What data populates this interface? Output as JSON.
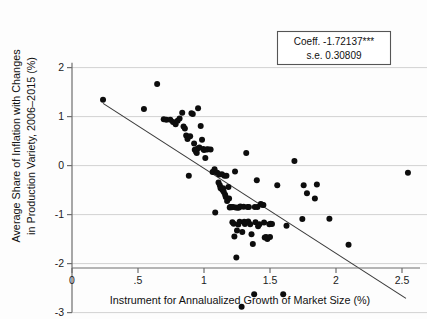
{
  "chart_data": {
    "type": "scatter",
    "title": "",
    "xlabel": "Instrument for Annalualized Growth of Market Size (%)",
    "ylabel_line1": "Average Share of Inflation with Changes",
    "ylabel_line2": "in Production Variety, 2006–2015 (%)",
    "xlim": [
      0,
      2.6
    ],
    "ylim": [
      -3.1,
      2.1
    ],
    "grid": "horizontal",
    "legend_position": "top-right",
    "xticks": [
      0,
      0.5,
      1,
      1.5,
      2,
      2.5
    ],
    "xticklabels": [
      "0",
      ".5",
      "1",
      "1.5",
      "2",
      "2.5"
    ],
    "yticks": [
      2,
      1,
      0,
      -1,
      -2,
      -3
    ],
    "yticklabels": [
      "2",
      "1",
      "0",
      "-1",
      "-2",
      "-3"
    ],
    "annotations": {
      "coefficient_label": "Coeff. -1.72137***",
      "std_error_label": "s.e. 0.30809",
      "coefficient_value": -1.72137,
      "std_error_value": 0.30809,
      "significance": "***"
    },
    "fit_line": {
      "type": "linear",
      "x_start": 0.235,
      "y_start": 1.27,
      "x_end": 2.53,
      "y_end": -2.71
    },
    "points": [
      [
        0.235,
        1.345
      ],
      [
        0.545,
        1.155
      ],
      [
        0.645,
        1.665
      ],
      [
        0.695,
        0.945
      ],
      [
        0.715,
        0.935
      ],
      [
        0.745,
        0.935
      ],
      [
        0.765,
        0.89
      ],
      [
        0.785,
        0.845
      ],
      [
        0.8,
        0.915
      ],
      [
        0.815,
        0.96
      ],
      [
        0.835,
        1.08
      ],
      [
        0.845,
        0.8
      ],
      [
        0.855,
        0.755
      ],
      [
        0.865,
        0.615
      ],
      [
        0.875,
        0.545
      ],
      [
        0.885,
        -0.205
      ],
      [
        0.895,
        0.6
      ],
      [
        0.905,
        1.07
      ],
      [
        0.915,
        1.055
      ],
      [
        0.925,
        0.45
      ],
      [
        0.93,
        0.325
      ],
      [
        0.94,
        0.285
      ],
      [
        0.945,
        0.255
      ],
      [
        0.95,
        0.345
      ],
      [
        0.955,
        1.17
      ],
      [
        0.965,
        0.37
      ],
      [
        0.975,
        0.81
      ],
      [
        0.985,
        0.53
      ],
      [
        0.995,
        0.34
      ],
      [
        1.0,
        0.32
      ],
      [
        1.01,
        0.155
      ],
      [
        1.02,
        0.33
      ],
      [
        1.03,
        0.335
      ],
      [
        1.05,
        0.33
      ],
      [
        1.065,
        -0.13
      ],
      [
        1.075,
        -0.125
      ],
      [
        1.08,
        -0.075
      ],
      [
        1.085,
        -0.955
      ],
      [
        1.1,
        -0.145
      ],
      [
        1.11,
        -0.345
      ],
      [
        1.115,
        -0.18
      ],
      [
        1.12,
        -0.4
      ],
      [
        1.125,
        -0.455
      ],
      [
        1.13,
        -0.465
      ],
      [
        1.135,
        -0.175
      ],
      [
        1.14,
        -0.5
      ],
      [
        1.145,
        -0.46
      ],
      [
        1.15,
        -0.54
      ],
      [
        1.155,
        -0.205
      ],
      [
        1.16,
        -0.595
      ],
      [
        1.165,
        -0.64
      ],
      [
        1.17,
        -0.205
      ],
      [
        1.175,
        -0.72
      ],
      [
        1.185,
        -0.435
      ],
      [
        1.19,
        -0.67
      ],
      [
        1.195,
        -0.855
      ],
      [
        1.2,
        -0.845
      ],
      [
        1.21,
        -0.85
      ],
      [
        1.215,
        -1.155
      ],
      [
        1.22,
        -0.845
      ],
      [
        1.225,
        -1.185
      ],
      [
        1.23,
        -1.445
      ],
      [
        1.235,
        -0.12
      ],
      [
        1.24,
        -0.855
      ],
      [
        1.245,
        -1.875
      ],
      [
        1.25,
        -1.325
      ],
      [
        1.255,
        -0.86
      ],
      [
        1.26,
        -1.2
      ],
      [
        1.265,
        -0.855
      ],
      [
        1.27,
        -1.145
      ],
      [
        1.275,
        -0.835
      ],
      [
        1.285,
        -2.88
      ],
      [
        1.29,
        -1.355
      ],
      [
        1.3,
        -0.84
      ],
      [
        1.305,
        -1.145
      ],
      [
        1.31,
        -1.19
      ],
      [
        1.32,
        0.255
      ],
      [
        1.33,
        -0.845
      ],
      [
        1.335,
        -1.14
      ],
      [
        1.34,
        -0.845
      ],
      [
        1.35,
        -1.195
      ],
      [
        1.36,
        -1.4
      ],
      [
        1.37,
        -1.6
      ],
      [
        1.38,
        -2.625
      ],
      [
        1.385,
        -0.845
      ],
      [
        1.39,
        -1.155
      ],
      [
        1.4,
        -0.3
      ],
      [
        1.405,
        -0.845
      ],
      [
        1.41,
        -1.24
      ],
      [
        1.42,
        -1.195
      ],
      [
        1.43,
        -0.785
      ],
      [
        1.44,
        -0.8
      ],
      [
        1.45,
        -0.805
      ],
      [
        1.455,
        -1.16
      ],
      [
        1.46,
        -1.465
      ],
      [
        1.47,
        -1.455
      ],
      [
        1.48,
        -1.5
      ],
      [
        1.495,
        -1.195
      ],
      [
        1.5,
        -1.455
      ],
      [
        1.505,
        -1.185
      ],
      [
        1.515,
        -1.19
      ],
      [
        1.555,
        -0.4
      ],
      [
        1.6,
        -2.625
      ],
      [
        1.625,
        -1.225
      ],
      [
        1.685,
        0.095
      ],
      [
        1.745,
        -1.09
      ],
      [
        1.755,
        -0.4
      ],
      [
        1.78,
        -0.565
      ],
      [
        1.84,
        -0.67
      ],
      [
        1.855,
        -0.385
      ],
      [
        1.95,
        -1.085
      ],
      [
        2.095,
        -1.615
      ],
      [
        2.545,
        -0.145
      ]
    ]
  }
}
